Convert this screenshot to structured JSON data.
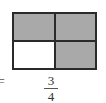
{
  "diagram": {
    "grid": {
      "rows": 2,
      "cols": 2,
      "cells": [
        {
          "position": "top-left",
          "shaded": true
        },
        {
          "position": "top-right",
          "shaded": true
        },
        {
          "position": "bottom-left",
          "shaded": false
        },
        {
          "position": "bottom-right",
          "shaded": true
        }
      ],
      "shade_color": "#a9a9a9",
      "empty_color": "#ffffff"
    },
    "equation": {
      "sign": "=",
      "numerator": "3",
      "denominator": "4"
    }
  }
}
